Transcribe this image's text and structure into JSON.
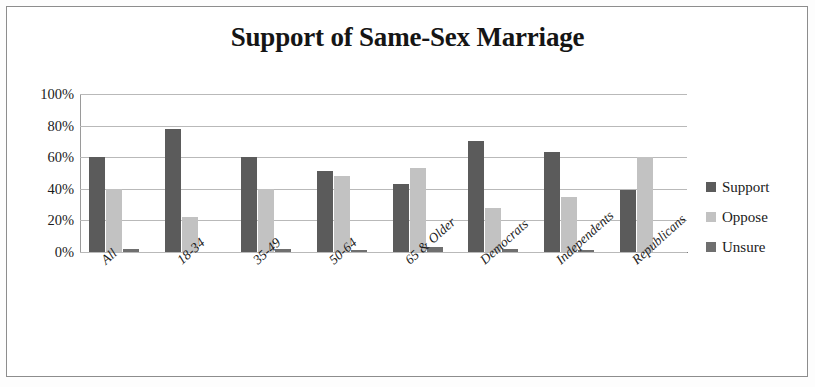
{
  "chart_data": {
    "type": "bar",
    "title": "Support of Same-Sex Marriage",
    "xlabel": "",
    "ylabel": "",
    "ylim": [
      0,
      100
    ],
    "yticks": [
      "0%",
      "20%",
      "40%",
      "60%",
      "80%",
      "100%"
    ],
    "ytick_values": [
      0,
      20,
      40,
      60,
      80,
      100
    ],
    "grid": true,
    "legend_position": "right",
    "categories": [
      "All",
      "18-34",
      "35-49",
      "50-64",
      "65 & Older",
      "Democrats",
      "Independents",
      "Republicans"
    ],
    "series": [
      {
        "name": "Support",
        "color": "#5b5b5b",
        "values": [
          60,
          78,
          60,
          51,
          43,
          70,
          63,
          39
        ]
      },
      {
        "name": "Oppose",
        "color": "#c2c2c2",
        "values": [
          40,
          22,
          40,
          48,
          53,
          28,
          35,
          60
        ]
      },
      {
        "name": "Unsure",
        "color": "#6f6f6f",
        "values": [
          2,
          0,
          2,
          1,
          3,
          2,
          1,
          0
        ]
      }
    ]
  },
  "legend": {
    "items": [
      {
        "label": "Support"
      },
      {
        "label": "Oppose"
      },
      {
        "label": "Unsure"
      }
    ]
  }
}
